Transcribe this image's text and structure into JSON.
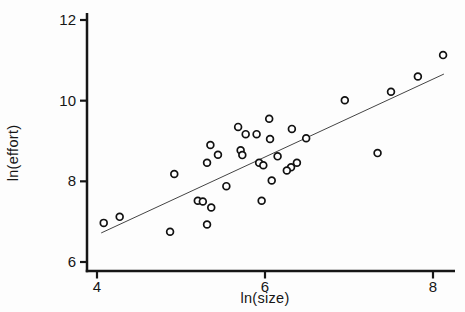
{
  "figure": {
    "background": "#fdfdfd",
    "axis_color": "#161616",
    "marker_color": "#111111",
    "line_color": "#444444"
  },
  "chart_data": {
    "type": "scatter",
    "title": "",
    "xlabel": "ln(size)",
    "ylabel": "ln(effort)",
    "xlim": [
      3.85,
      8.4
    ],
    "ylim": [
      5.7,
      12.2
    ],
    "x_ticks": [
      4,
      6,
      8
    ],
    "y_ticks": [
      6,
      8,
      10,
      12
    ],
    "grid": false,
    "legend": null,
    "marker": "open-circle",
    "points": [
      [
        4.08,
        6.97
      ],
      [
        4.27,
        7.12
      ],
      [
        4.87,
        6.75
      ],
      [
        4.92,
        8.18
      ],
      [
        5.2,
        7.52
      ],
      [
        5.26,
        7.5
      ],
      [
        5.36,
        7.35
      ],
      [
        5.31,
        6.93
      ],
      [
        5.35,
        8.9
      ],
      [
        5.31,
        8.46
      ],
      [
        5.44,
        8.66
      ],
      [
        5.54,
        7.88
      ],
      [
        5.68,
        9.35
      ],
      [
        5.77,
        9.17
      ],
      [
        5.9,
        9.17
      ],
      [
        6.05,
        9.55
      ],
      [
        6.06,
        9.05
      ],
      [
        6.32,
        9.3
      ],
      [
        6.49,
        9.07
      ],
      [
        5.71,
        8.77
      ],
      [
        5.73,
        8.65
      ],
      [
        5.93,
        8.46
      ],
      [
        5.98,
        8.4
      ],
      [
        6.15,
        8.62
      ],
      [
        6.38,
        8.46
      ],
      [
        6.31,
        8.35
      ],
      [
        6.26,
        8.27
      ],
      [
        6.08,
        8.02
      ],
      [
        5.96,
        7.52
      ],
      [
        7.34,
        8.7
      ],
      [
        6.95,
        10.01
      ],
      [
        7.5,
        10.22
      ],
      [
        7.82,
        10.6
      ],
      [
        8.12,
        11.13
      ]
    ],
    "regression_line": {
      "x1": 4.05,
      "y1": 6.72,
      "x2": 8.13,
      "y2": 10.66,
      "slope": 0.97,
      "intercept": 2.8
    }
  }
}
